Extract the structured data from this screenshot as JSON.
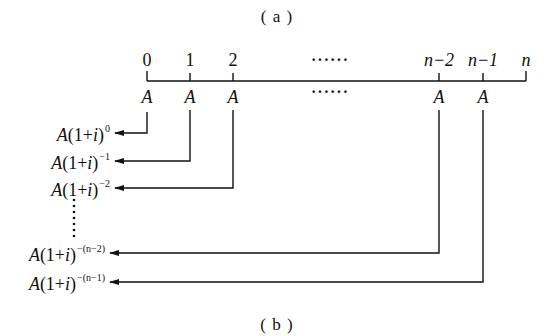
{
  "captions": {
    "top": "( a )",
    "bottom": "( b )"
  },
  "timeline": {
    "ticks": [
      {
        "label": "0",
        "x": 147,
        "italic": false
      },
      {
        "label": "1",
        "x": 190,
        "italic": false
      },
      {
        "label": "2",
        "x": 233,
        "italic": false
      },
      {
        "label": "n−2",
        "x": 439,
        "italic": true
      },
      {
        "label": "n−1",
        "x": 483,
        "italic": true
      },
      {
        "label": "n",
        "x": 526,
        "italic": true
      }
    ],
    "ellipsis_top": "······",
    "ellipsis_bottom": "······",
    "payment_label": "A",
    "payments_at": [
      "0",
      "1",
      "2",
      "n−2",
      "n−1"
    ]
  },
  "present_values": [
    {
      "base": "A(1+i)",
      "exponent": "0",
      "from_tick": "0"
    },
    {
      "base": "A(1+i)",
      "exponent": "−1",
      "from_tick": "1"
    },
    {
      "base": "A(1+i)",
      "exponent": "−2",
      "from_tick": "2"
    },
    {
      "base": "A(1+i)",
      "exponent": "−(n−2)",
      "from_tick": "n−2"
    },
    {
      "base": "A(1+i)",
      "exponent": "−(n−1)",
      "from_tick": "n−1"
    }
  ],
  "vertical_ellipsis": "⋮"
}
